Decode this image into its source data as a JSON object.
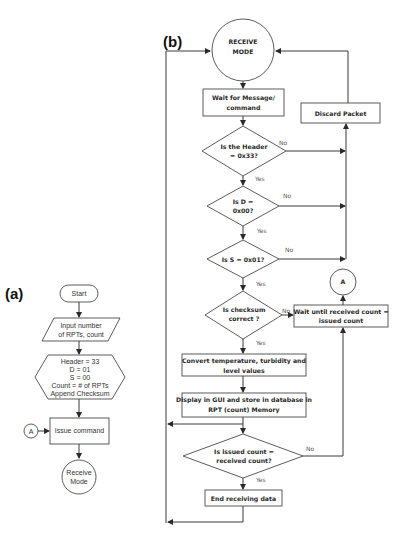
{
  "panels": {
    "a": {
      "label": "(a)",
      "nodes": {
        "start": "Start",
        "input_line1": "Input number",
        "input_line2": "of RPTs, count",
        "prep_lines": [
          "Header = 33",
          "D = 01",
          "S = 00",
          "Count = # of RPTs",
          "Append Checksum"
        ],
        "connector": "A",
        "issue": "Issue command",
        "receive_line1": "Receive",
        "receive_line2": "Mode"
      }
    },
    "b": {
      "label": "(b)",
      "nodes": {
        "receive_line1": "RECEIVE",
        "receive_line2": "MODE",
        "wait_line1": "Wait for Message/",
        "wait_line2": "command",
        "discard": "Discard Packet",
        "header_line1": "Is the Header",
        "header_line2": "= 0x33?",
        "d_line1": "Is D =",
        "d_line2": "0x00?",
        "s_line1": "Is S = 0x01?",
        "checksum_line1": "Is checksum",
        "checksum_line2": "correct ?",
        "waitcount_line1": "Wait until received count =",
        "waitcount_line2": "issued count",
        "connector": "A",
        "convert_line1": "Convert temperature, turbidity and",
        "convert_line2": "level values",
        "display_line1": "Display in GUI and store in database in",
        "display_line2": "RPT (count) Memory",
        "issued_line1": "Is issued count =",
        "issued_line2": "received count?",
        "end": "End receiving data"
      },
      "edge_labels": {
        "yes": "Yes",
        "no": "No"
      }
    }
  }
}
